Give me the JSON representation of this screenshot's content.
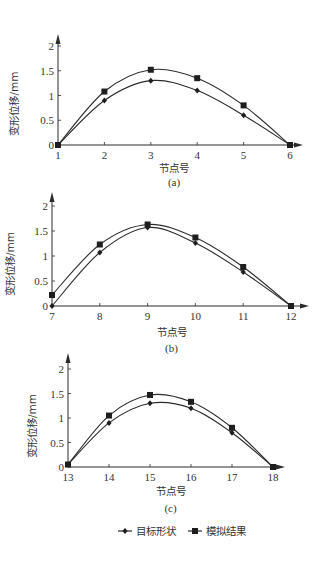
{
  "chart_data": [
    {
      "type": "line",
      "panel": "(a)",
      "caption": "(a)",
      "xlabel": "节点号",
      "ylabel": "变形位移/mm",
      "x": [
        1,
        2,
        3,
        4,
        5,
        6
      ],
      "ylim": [
        0,
        2
      ],
      "yticks": [
        "0",
        "0.5",
        "1",
        "1.5",
        "2"
      ],
      "series": [
        {
          "name": "目标形状",
          "marker": "diamond",
          "values": [
            0,
            0.9,
            1.3,
            1.1,
            0.6,
            0
          ]
        },
        {
          "name": "模拟结果",
          "marker": "square",
          "values": [
            0,
            1.08,
            1.52,
            1.35,
            0.8,
            0
          ]
        }
      ],
      "grid": false
    },
    {
      "type": "line",
      "panel": "(b)",
      "caption": "(b)",
      "xlabel": "节点号",
      "ylabel": "变形位移/mm",
      "x": [
        7,
        8,
        9,
        10,
        11,
        12
      ],
      "ylim": [
        0,
        2
      ],
      "yticks": [
        "0",
        "0.5",
        "1",
        "1.5",
        "2"
      ],
      "series": [
        {
          "name": "目标形状",
          "marker": "diamond",
          "values": [
            0,
            1.07,
            1.57,
            1.26,
            0.68,
            0
          ]
        },
        {
          "name": "模拟结果",
          "marker": "square",
          "values": [
            0.22,
            1.23,
            1.63,
            1.37,
            0.78,
            0
          ]
        }
      ],
      "grid": false
    },
    {
      "type": "line",
      "panel": "(c)",
      "caption": "(c)",
      "xlabel": "节点号",
      "ylabel": "变形位移/mm",
      "x": [
        13,
        14,
        15,
        16,
        17,
        18
      ],
      "ylim": [
        0,
        2
      ],
      "yticks": [
        "0",
        "0.5",
        "1",
        "1.5",
        "2"
      ],
      "series": [
        {
          "name": "目标形状",
          "marker": "diamond",
          "values": [
            0.05,
            0.9,
            1.3,
            1.2,
            0.7,
            0
          ]
        },
        {
          "name": "模拟结果",
          "marker": "square",
          "values": [
            0.05,
            1.05,
            1.47,
            1.33,
            0.8,
            0
          ]
        }
      ],
      "grid": false
    }
  ],
  "legend": {
    "position": "bottom",
    "items": [
      {
        "label": "目标形状",
        "marker": "diamond"
      },
      {
        "label": "模拟结果",
        "marker": "square"
      }
    ]
  },
  "layout": {
    "panels": [
      {
        "x0": 58,
        "y0": 145,
        "xstep": 46.4,
        "yscale": 49.5,
        "arrowTop": 34,
        "arrowRight": 303,
        "ylabX": 18,
        "captionY": 186,
        "xlabY": 172
      },
      {
        "x0": 52,
        "y0": 306,
        "xstep": 47.8,
        "yscale": 50,
        "arrowTop": 192,
        "arrowRight": 309,
        "ylabX": 14,
        "captionY": 352,
        "xlabY": 336
      },
      {
        "x0": 68,
        "y0": 467,
        "xstep": 41,
        "yscale": 49,
        "arrowTop": 353,
        "arrowRight": 285,
        "ylabX": 36,
        "captionY": 512,
        "xlabY": 495
      }
    ],
    "legendY": 531,
    "legendX": 118
  }
}
